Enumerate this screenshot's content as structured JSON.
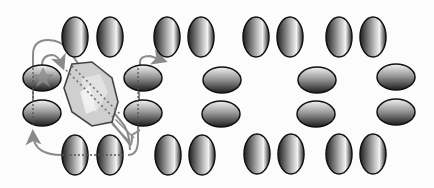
{
  "diagram": {
    "colors": {
      "background": "#fcfcfc",
      "ellipse_dark": "#1e1e1e",
      "ellipse_light": "#f2f2f2",
      "outline": "#111111",
      "arrow": "#8a8a8a",
      "guest_fill": "#cfcfcf",
      "dotted_axis": "#6e6e6e"
    },
    "vertical_molecules": [
      {
        "x": 75,
        "y": 37
      },
      {
        "x": 110,
        "y": 37
      },
      {
        "x": 167,
        "y": 37
      },
      {
        "x": 201,
        "y": 37
      },
      {
        "x": 256,
        "y": 37
      },
      {
        "x": 290,
        "y": 37
      },
      {
        "x": 339,
        "y": 37
      },
      {
        "x": 373,
        "y": 37
      },
      {
        "x": 75,
        "y": 155
      },
      {
        "x": 110,
        "y": 155
      },
      {
        "x": 168,
        "y": 155
      },
      {
        "x": 202,
        "y": 155
      },
      {
        "x": 257,
        "y": 154
      },
      {
        "x": 291,
        "y": 154
      },
      {
        "x": 339,
        "y": 154
      },
      {
        "x": 373,
        "y": 154
      }
    ],
    "horizontal_molecules": [
      {
        "x": 42,
        "y": 78
      },
      {
        "x": 42,
        "y": 113
      },
      {
        "x": 143,
        "y": 78
      },
      {
        "x": 143,
        "y": 113
      },
      {
        "x": 222,
        "y": 80
      },
      {
        "x": 221,
        "y": 114
      },
      {
        "x": 317,
        "y": 80
      },
      {
        "x": 316,
        "y": 114
      },
      {
        "x": 396,
        "y": 77
      },
      {
        "x": 396,
        "y": 112
      }
    ],
    "guest_molecule": {
      "label": "octagonal guest",
      "cx": 92,
      "cy": 95
    },
    "star_marker": {
      "cx": 43,
      "cy": 78
    }
  }
}
